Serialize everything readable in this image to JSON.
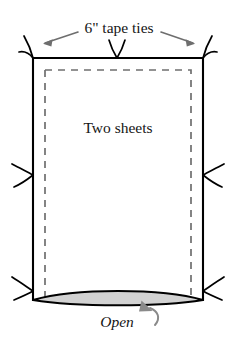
{
  "figure": {
    "type": "technical-illustration",
    "background_color": "#ffffff",
    "outline_color": "#000000",
    "seam_color": "#6f6f6f",
    "open_fill_color": "#d2d2d2",
    "leader_color": "#6e6e6e"
  },
  "labels": {
    "top": "6\" tape ties",
    "center": "Two sheets",
    "bottom": "Open"
  },
  "annotations": {
    "tie_count": 7,
    "tie_positions": [
      "top-left-corner",
      "top-center",
      "top-right-corner",
      "left-middle",
      "right-middle",
      "bottom-left-corner",
      "bottom-right-corner"
    ],
    "leader_arrow_directions": [
      "left",
      "right"
    ],
    "open_arrow_direction": "up-left"
  },
  "geometry": {
    "bag_left": 33,
    "bag_right": 203,
    "bag_top": 58,
    "bag_bottom": 300,
    "seam_inset": 12,
    "open_lens_top": 289,
    "open_lens_bottom": 303
  }
}
